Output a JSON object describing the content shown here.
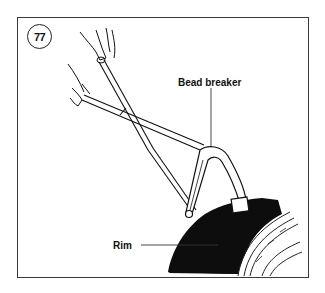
{
  "figure": {
    "number": "77",
    "labels": {
      "bead_breaker": "Bead breaker",
      "rim": "Rim"
    },
    "illustration": "hands operating bead breaker tool levers against tire and rim"
  },
  "colors": {
    "ink": "#111111",
    "frame": "#3a3a3a",
    "tire": "#0d0d0d",
    "background": "#ffffff"
  }
}
